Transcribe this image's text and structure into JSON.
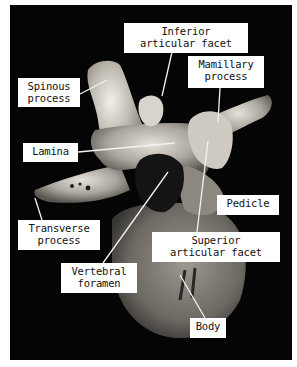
{
  "figure": {
    "background_color": "#050505",
    "label_color": "#ffffff",
    "leader_color": "#f2f2f2"
  },
  "labels": {
    "inferior_articular_facet": {
      "line1": "Inferior",
      "line2": "articular facet"
    },
    "mamillary_process": {
      "line1": "Mamillary",
      "line2": "process"
    },
    "spinous_process": {
      "line1": "Spinous",
      "line2": "process"
    },
    "lamina": {
      "line1": "Lamina"
    },
    "pedicle": {
      "line1": "Pedicle"
    },
    "transverse_process": {
      "line1": "Transverse",
      "line2": "process"
    },
    "superior_articular_facet": {
      "line1": "Superior",
      "line2": "articular facet"
    },
    "vertebral_foramen": {
      "line1": "Vertebral",
      "line2": "foramen"
    },
    "body": {
      "line1": "Body"
    }
  }
}
